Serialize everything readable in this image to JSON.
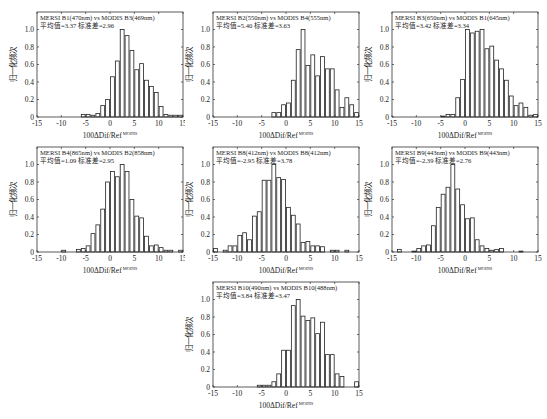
{
  "figure": {
    "ylabel": "归一化频次",
    "xlabel_main": "100ΔDif/Ref",
    "xlabel_sup": "MODIS",
    "xticks": [
      -15,
      -10,
      -5,
      0,
      5,
      10,
      15
    ],
    "yticks": [
      0,
      0.2,
      0.4,
      0.6,
      0.8,
      1.0
    ],
    "ytick_labels": [
      "0",
      "0.2",
      "0.4",
      "0.6",
      "0.8",
      "1.0"
    ],
    "bar_fill": "#ffffff",
    "bar_stroke": "#222222"
  },
  "chart_data": [
    {
      "type": "bar",
      "title": "MERSI B1(470nm)  vs  MODIS B3(469nm)",
      "subtitle": "平均值=3.37  标准差=2.96",
      "xlabel": "100ΔDif/Ref MODIS",
      "ylabel": "归一化频次",
      "xlim": [
        -15,
        15
      ],
      "ylim": [
        0,
        1.2
      ],
      "bin_edges_start": -15,
      "bin_width": 1,
      "values": [
        0,
        0,
        0,
        0,
        0,
        0,
        0,
        0,
        0,
        0.03,
        0.03,
        0.02,
        0.04,
        0.13,
        0.2,
        0.46,
        0.64,
        1.0,
        0.93,
        0.76,
        0.54,
        0.61,
        0.42,
        0.35,
        0.28,
        0.12,
        0.03,
        0.02,
        0.02,
        0.02
      ]
    },
    {
      "type": "bar",
      "title": "MERSI B2(550nm)  vs  MODIS B4(555nm)",
      "subtitle": "平均值=5.40  标准差=3.63",
      "xlabel": "100ΔDif/Ref MODIS",
      "ylabel": "归一化频次",
      "xlim": [
        -15,
        15
      ],
      "ylim": [
        0,
        1.2
      ],
      "bin_edges_start": -15,
      "bin_width": 1,
      "values": [
        0,
        0,
        0,
        0,
        0,
        0,
        0,
        0,
        0,
        0,
        0,
        0,
        0.05,
        0.05,
        0.14,
        0.16,
        0.42,
        0.77,
        1.0,
        0.59,
        0.71,
        0.47,
        0.69,
        0.55,
        0.55,
        0.31,
        0.11,
        0.22,
        0.14,
        0.05
      ]
    },
    {
      "type": "bar",
      "title": "MERSI B3(650nm)  vs  MODIS B1(645nm)",
      "subtitle": "平均值=3.42  标准差=3.34",
      "xlabel": "100ΔDif/Ref MODIS",
      "ylabel": "归一化频次",
      "xlim": [
        -15,
        15
      ],
      "ylim": [
        0,
        1.2
      ],
      "bin_edges_start": -15,
      "bin_width": 1,
      "values": [
        0,
        0,
        0,
        0,
        0,
        0,
        0,
        0,
        0,
        0,
        0.01,
        0.03,
        0.03,
        0.22,
        0.43,
        1.0,
        0.96,
        0.98,
        1.0,
        0.78,
        0.81,
        0.65,
        0.55,
        0.42,
        0.24,
        0.13,
        0.16,
        0.11,
        0.02,
        0.03
      ]
    },
    {
      "type": "bar",
      "title": "MERSI B4(865nm)  vs  MODIS B2(858nm)",
      "subtitle": "平均值=1.09  标准差=2.95",
      "xlabel": "100ΔDif/Ref MODIS",
      "ylabel": "归一化频次",
      "xlim": [
        -15,
        15
      ],
      "ylim": [
        0,
        1.2
      ],
      "bin_edges_start": -15,
      "bin_width": 1,
      "values": [
        0,
        0,
        0,
        0,
        0,
        0.02,
        0,
        0,
        0.03,
        0.04,
        0.07,
        0.21,
        0.31,
        0.49,
        0.8,
        0.92,
        0.86,
        1.0,
        0.92,
        0.6,
        0.41,
        0.39,
        0.18,
        0.07,
        0.08,
        0.05,
        0.02,
        0.02,
        0,
        0.02
      ]
    },
    {
      "type": "bar",
      "title": "MERSI B8(412nm)  vs  MODIS B8(412nm)",
      "subtitle": "平均值=-2.95  标准差=3.78",
      "xlabel": "100ΔDif/Ref MODIS",
      "ylabel": "归一化频次",
      "xlim": [
        -15,
        15
      ],
      "ylim": [
        0,
        1.2
      ],
      "bin_edges_start": -15,
      "bin_width": 1,
      "values": [
        0.04,
        0,
        0.02,
        0.07,
        0.07,
        0.19,
        0.22,
        0.14,
        0.41,
        0.46,
        0.82,
        0.82,
        1.0,
        0.85,
        0.83,
        0.51,
        0.42,
        0.32,
        0.11,
        0.12,
        0.07,
        0.07,
        0.06,
        0,
        0.02,
        0.02,
        0,
        0.02,
        0,
        0
      ]
    },
    {
      "type": "bar",
      "title": "MERSI B9(443nm)  vs  MODIS B9(443nm)",
      "subtitle": "平均值=-2.39  标准差=2.76",
      "xlabel": "100ΔDif/Ref MODIS",
      "ylabel": "归一化频次",
      "xlim": [
        -15,
        15
      ],
      "ylim": [
        0,
        1.2
      ],
      "bin_edges_start": -15,
      "bin_width": 1,
      "values": [
        0,
        0.03,
        0,
        0,
        0.01,
        0.04,
        0.07,
        0.08,
        0.3,
        0.51,
        0.66,
        0.74,
        1.0,
        0.72,
        0.54,
        0.38,
        0.39,
        0.14,
        0.07,
        0.04,
        0.02,
        0.03,
        0.04,
        0,
        0,
        0,
        0.01,
        0,
        0,
        0
      ]
    },
    {
      "type": "bar",
      "title": "MERSI B10(490nm)  vs  MODIS B10(488nm)",
      "subtitle": "平均值=3.84  标准差=3.47",
      "xlabel": "100ΔDif/Ref MODIS",
      "ylabel": "归一化频次",
      "xlim": [
        -15,
        15
      ],
      "ylim": [
        0,
        1.2
      ],
      "bin_edges_start": -15,
      "bin_width": 1,
      "values": [
        0,
        0,
        0,
        0,
        0,
        0,
        0,
        0,
        0,
        0.02,
        0.02,
        0.02,
        0.06,
        0.15,
        0.42,
        0.42,
        0.93,
        1.0,
        0.81,
        0.76,
        0.79,
        0.61,
        0.74,
        0.37,
        0.37,
        0.15,
        0.12,
        0,
        0,
        0.06
      ]
    }
  ]
}
